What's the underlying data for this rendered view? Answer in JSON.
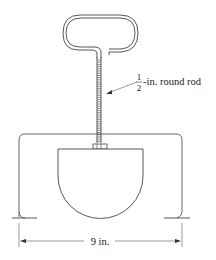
{
  "diagram": {
    "rod_label": {
      "numerator": "1",
      "denominator": "2",
      "suffix": "-in. round rod"
    },
    "dimension_label": "9 in.",
    "colors": {
      "stroke": "#333333",
      "background": "#ffffff"
    }
  }
}
